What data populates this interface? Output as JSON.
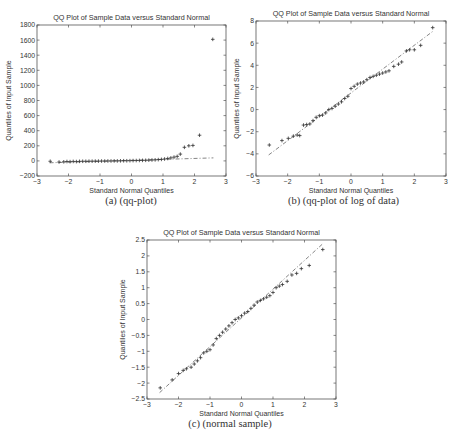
{
  "figure": {
    "captions": [
      "(a) (qq-plot)",
      "(b) (qq-plot of log of data)",
      "(c) (normal sample)"
    ]
  },
  "chart_data": [
    {
      "id": "a",
      "type": "scatter",
      "title": "QQ Plot of Sample Data versus Standard Normal",
      "xlabel": "Standard Normal Quantiles",
      "ylabel": "Quantiles of Input Sample",
      "xlim": [
        -3,
        3
      ],
      "ylim": [
        -200,
        1800
      ],
      "xticks": [
        -3,
        -2,
        -1,
        0,
        1,
        2,
        3
      ],
      "yticks": [
        -200,
        0,
        200,
        400,
        600,
        800,
        1000,
        1200,
        1400,
        1600,
        1800
      ],
      "grid": false,
      "reference_line": {
        "x": [
          -2.6,
          2.6
        ],
        "y": [
          -25,
          40
        ]
      },
      "points": [
        [
          -2.58,
          -5
        ],
        [
          -2.3,
          -15
        ],
        [
          -2.15,
          -12
        ],
        [
          -2.05,
          -8
        ],
        [
          -1.95,
          -10
        ],
        [
          -1.85,
          -7
        ],
        [
          -1.75,
          -9
        ],
        [
          -1.65,
          -6
        ],
        [
          -1.55,
          -5
        ],
        [
          -1.45,
          -5
        ],
        [
          -1.35,
          -4
        ],
        [
          -1.25,
          -4
        ],
        [
          -1.15,
          -3
        ],
        [
          -1.05,
          -3
        ],
        [
          -0.95,
          -2
        ],
        [
          -0.85,
          -2
        ],
        [
          -0.75,
          -1
        ],
        [
          -0.65,
          -1
        ],
        [
          -0.55,
          0
        ],
        [
          -0.45,
          0
        ],
        [
          -0.35,
          1
        ],
        [
          -0.25,
          2
        ],
        [
          -0.15,
          2
        ],
        [
          -0.05,
          3
        ],
        [
          0.05,
          4
        ],
        [
          0.15,
          5
        ],
        [
          0.25,
          6
        ],
        [
          0.35,
          7
        ],
        [
          0.45,
          8
        ],
        [
          0.55,
          10
        ],
        [
          0.65,
          12
        ],
        [
          0.75,
          14
        ],
        [
          0.85,
          17
        ],
        [
          0.95,
          20
        ],
        [
          1.05,
          25
        ],
        [
          1.15,
          32
        ],
        [
          1.25,
          40
        ],
        [
          1.35,
          50
        ],
        [
          1.45,
          60
        ],
        [
          1.55,
          90
        ],
        [
          1.68,
          180
        ],
        [
          1.82,
          200
        ],
        [
          1.95,
          205
        ],
        [
          2.16,
          340
        ],
        [
          2.58,
          1610
        ]
      ]
    },
    {
      "id": "b",
      "type": "scatter",
      "title": "QQ Plot of Sample Data versus Standard Normal",
      "xlabel": "Standard Normal Quantiles",
      "ylabel": "Quantiles of Input Sample",
      "xlim": [
        -3,
        3
      ],
      "ylim": [
        -6,
        8
      ],
      "xticks": [
        -3,
        -2,
        -1,
        0,
        1,
        2,
        3
      ],
      "yticks": [
        -6,
        -4,
        -2,
        0,
        2,
        4,
        6,
        8
      ],
      "grid": false,
      "reference_line": {
        "x": [
          -2.6,
          2.6
        ],
        "y": [
          -4.1,
          7.1
        ]
      },
      "points": [
        [
          -2.58,
          -3.2
        ],
        [
          -2.18,
          -2.8
        ],
        [
          -1.98,
          -2.6
        ],
        [
          -1.82,
          -2.4
        ],
        [
          -1.7,
          -2.3
        ],
        [
          -1.62,
          -2.35
        ],
        [
          -1.5,
          -1.4
        ],
        [
          -1.4,
          -1.35
        ],
        [
          -1.3,
          -1.3
        ],
        [
          -1.2,
          -1.0
        ],
        [
          -1.1,
          -0.7
        ],
        [
          -1.0,
          -0.55
        ],
        [
          -0.9,
          -0.5
        ],
        [
          -0.8,
          -0.3
        ],
        [
          -0.7,
          0.0
        ],
        [
          -0.6,
          0.1
        ],
        [
          -0.5,
          0.3
        ],
        [
          -0.4,
          0.5
        ],
        [
          -0.3,
          0.7
        ],
        [
          -0.2,
          1.0
        ],
        [
          -0.1,
          1.2
        ],
        [
          0.0,
          1.9
        ],
        [
          0.1,
          2.1
        ],
        [
          0.2,
          2.3
        ],
        [
          0.3,
          2.4
        ],
        [
          0.4,
          2.5
        ],
        [
          0.5,
          2.7
        ],
        [
          0.6,
          2.9
        ],
        [
          0.7,
          3.0
        ],
        [
          0.8,
          3.1
        ],
        [
          0.9,
          3.2
        ],
        [
          1.0,
          3.3
        ],
        [
          1.1,
          3.4
        ],
        [
          1.2,
          3.5
        ],
        [
          1.35,
          3.9
        ],
        [
          1.5,
          4.1
        ],
        [
          1.6,
          4.3
        ],
        [
          1.75,
          5.3
        ],
        [
          1.85,
          5.4
        ],
        [
          2.0,
          5.4
        ],
        [
          2.2,
          5.8
        ],
        [
          2.58,
          7.4
        ]
      ]
    },
    {
      "id": "c",
      "type": "scatter",
      "title": "QQ Plot of Sample Data versus Standard Normal",
      "xlabel": "Standard Normal Quantiles",
      "ylabel": "Quantiles of Input Sample",
      "xlim": [
        -3,
        3
      ],
      "ylim": [
        -2.5,
        2.5
      ],
      "xticks": [
        -3,
        -2,
        -1,
        0,
        1,
        2,
        3
      ],
      "yticks": [
        -2.5,
        -2,
        -1.5,
        -1,
        -0.5,
        0,
        0.5,
        1,
        1.5,
        2,
        2.5
      ],
      "grid": false,
      "reference_line": {
        "x": [
          -2.6,
          2.6
        ],
        "y": [
          -2.3,
          2.4
        ]
      },
      "points": [
        [
          -2.58,
          -2.15
        ],
        [
          -2.2,
          -1.9
        ],
        [
          -2.0,
          -1.7
        ],
        [
          -1.85,
          -1.6
        ],
        [
          -1.75,
          -1.55
        ],
        [
          -1.6,
          -1.5
        ],
        [
          -1.5,
          -1.4
        ],
        [
          -1.4,
          -1.3
        ],
        [
          -1.3,
          -1.2
        ],
        [
          -1.2,
          -1.05
        ],
        [
          -1.1,
          -1.0
        ],
        [
          -1.0,
          -0.95
        ],
        [
          -0.9,
          -0.8
        ],
        [
          -0.8,
          -0.6
        ],
        [
          -0.7,
          -0.5
        ],
        [
          -0.6,
          -0.4
        ],
        [
          -0.5,
          -0.3
        ],
        [
          -0.4,
          -0.2
        ],
        [
          -0.3,
          -0.1
        ],
        [
          -0.2,
          0.0
        ],
        [
          -0.1,
          0.05
        ],
        [
          0.0,
          0.12
        ],
        [
          0.1,
          0.2
        ],
        [
          0.2,
          0.25
        ],
        [
          0.3,
          0.35
        ],
        [
          0.4,
          0.45
        ],
        [
          0.5,
          0.55
        ],
        [
          0.6,
          0.6
        ],
        [
          0.7,
          0.65
        ],
        [
          0.8,
          0.7
        ],
        [
          0.9,
          0.75
        ],
        [
          1.0,
          0.85
        ],
        [
          1.1,
          1.0
        ],
        [
          1.2,
          1.05
        ],
        [
          1.3,
          1.1
        ],
        [
          1.45,
          1.2
        ],
        [
          1.6,
          1.4
        ],
        [
          1.75,
          1.45
        ],
        [
          1.9,
          1.6
        ],
        [
          2.15,
          1.7
        ],
        [
          2.58,
          2.2
        ]
      ]
    }
  ]
}
